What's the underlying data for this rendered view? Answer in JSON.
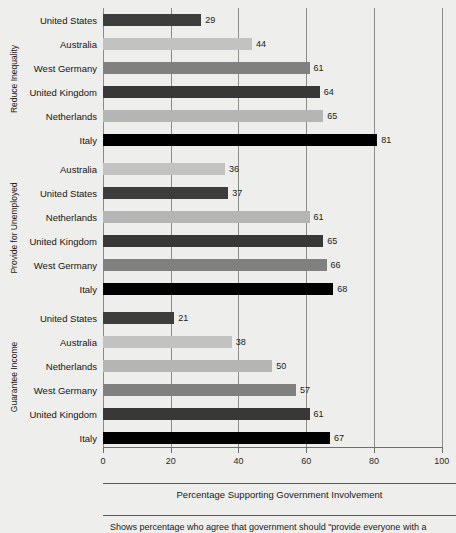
{
  "chart_data": {
    "type": "bar",
    "orientation": "horizontal",
    "title": "",
    "xlabel": "Percentage Supporting Government Involvement",
    "ylabel": "",
    "xlim": [
      0,
      100
    ],
    "xticks": [
      0,
      20,
      40,
      60,
      80,
      100
    ],
    "xtick_labels": [
      "0",
      "20",
      "40",
      "60",
      "80",
      "100"
    ],
    "grid": "vertical",
    "legend": "none",
    "value_labels": true,
    "footnote": "Shows percentage who agree that government should \"provide everyone with a",
    "series_colors": {
      "United States": "#3d3d3d",
      "Australia": "#c2c2c2",
      "West Germany": "#808080",
      "United Kingdom": "#383838",
      "Netherlands": "#b5b5b5",
      "Italy": "#000000"
    },
    "panels": [
      {
        "label": "Reduce Inequality",
        "categories": [
          "United States",
          "Australia",
          "West Germany",
          "United Kingdom",
          "Netherlands",
          "Italy"
        ],
        "values": [
          29,
          44,
          61,
          64,
          65,
          81
        ]
      },
      {
        "label": "Provide for Unemployed",
        "categories": [
          "Australia",
          "United States",
          "Netherlands",
          "United Kingdom",
          "West Germany",
          "Italy"
        ],
        "values": [
          36,
          37,
          61,
          65,
          66,
          68
        ]
      },
      {
        "label": "Guarantee Income",
        "categories": [
          "United States",
          "Australia",
          "Netherlands",
          "West Germany",
          "United Kingdom",
          "Italy"
        ],
        "values": [
          21,
          38,
          50,
          57,
          61,
          67
        ]
      }
    ]
  }
}
